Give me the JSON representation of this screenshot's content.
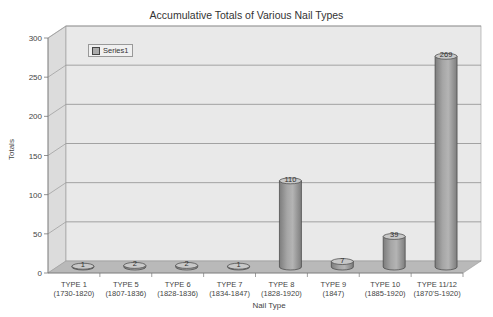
{
  "chart_data": {
    "type": "bar",
    "style": "3d-cylinder",
    "title": "Accumulative Totals of Various Nail Types",
    "xlabel": "Nail Type",
    "ylabel": "Totals",
    "ylim": [
      0,
      300
    ],
    "yticks": [
      0,
      50,
      100,
      150,
      200,
      250,
      300
    ],
    "grid": true,
    "legend": {
      "position": "top-left-inside",
      "entries": [
        "Series1"
      ]
    },
    "categories": [
      [
        "TYPE 1",
        "(1730-1820)"
      ],
      [
        "TYPE 5",
        "(1807-1836)"
      ],
      [
        "TYPE 6",
        "(1828-1836)"
      ],
      [
        "TYPE 7",
        "(1834-1847)"
      ],
      [
        "TYPE 8",
        "(1828-1920)"
      ],
      [
        "TYPE 9",
        "(1847)"
      ],
      [
        "TYPE 10",
        "(1885-1920)"
      ],
      [
        "TYPE 11/12",
        "(1870'S-1920)"
      ]
    ],
    "series": [
      {
        "name": "Series1",
        "values": [
          1,
          2,
          2,
          1,
          110,
          7,
          39,
          269
        ]
      }
    ]
  },
  "colors": {
    "wall": "#e9e9e9",
    "floor": "#b9b9b9",
    "grid": "#9a9a9a",
    "bar": "#a6a6a6",
    "bar_dark": "#7d7d7d",
    "bar_top": "#c8c8c8",
    "axis_text": "#444444"
  }
}
